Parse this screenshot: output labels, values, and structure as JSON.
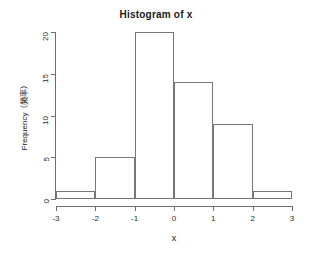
{
  "chart_data": {
    "type": "bar",
    "title": "Histogram of x",
    "xlabel": "x",
    "ylabel": "Frequency（頻率）",
    "categories": [
      "-3 to -2",
      "-2 to -1",
      "-1 to 0",
      "0 to 1",
      "1 to 2",
      "2 to 3"
    ],
    "bin_edges": [
      -3,
      -2,
      -1,
      0,
      1,
      2,
      3
    ],
    "values": [
      1,
      5,
      20,
      14,
      9,
      1
    ],
    "xlim": [
      -3,
      3
    ],
    "ylim": [
      0,
      20
    ],
    "x_ticks": [
      "-3",
      "-2",
      "-1",
      "0",
      "1",
      "2",
      "3"
    ],
    "x_tick_values": [
      -3,
      -2,
      -1,
      0,
      1,
      2,
      3
    ],
    "y_ticks": [
      "0",
      "5",
      "10",
      "15",
      "20"
    ],
    "y_tick_values": [
      0,
      5,
      10,
      15,
      20
    ],
    "grid": false,
    "legend": false,
    "bar_fill_color": "#ffffff",
    "bar_border_color": "#777777",
    "axis_color": "#6e6e6e",
    "text_color": "#1a1a1a"
  }
}
